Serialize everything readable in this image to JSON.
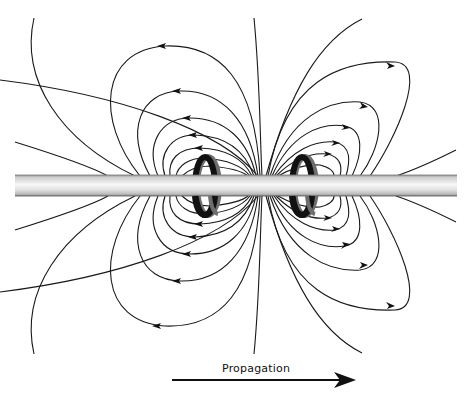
{
  "diagram": {
    "elements": {
      "rod": {
        "label": "rod",
        "color_light": "#f4f4f4",
        "color_dark": "#9a9a9a"
      },
      "coils": [
        {
          "id": "left-coil",
          "color_front": "#111111",
          "color_band": "#6e6e6e"
        },
        {
          "id": "right-coil",
          "color_front": "#111111",
          "color_band": "#6e6e6e"
        }
      ],
      "field_lines_color": "#1a1a1a"
    },
    "propagation": {
      "label": "Propagation",
      "arrow_direction": "right"
    }
  }
}
